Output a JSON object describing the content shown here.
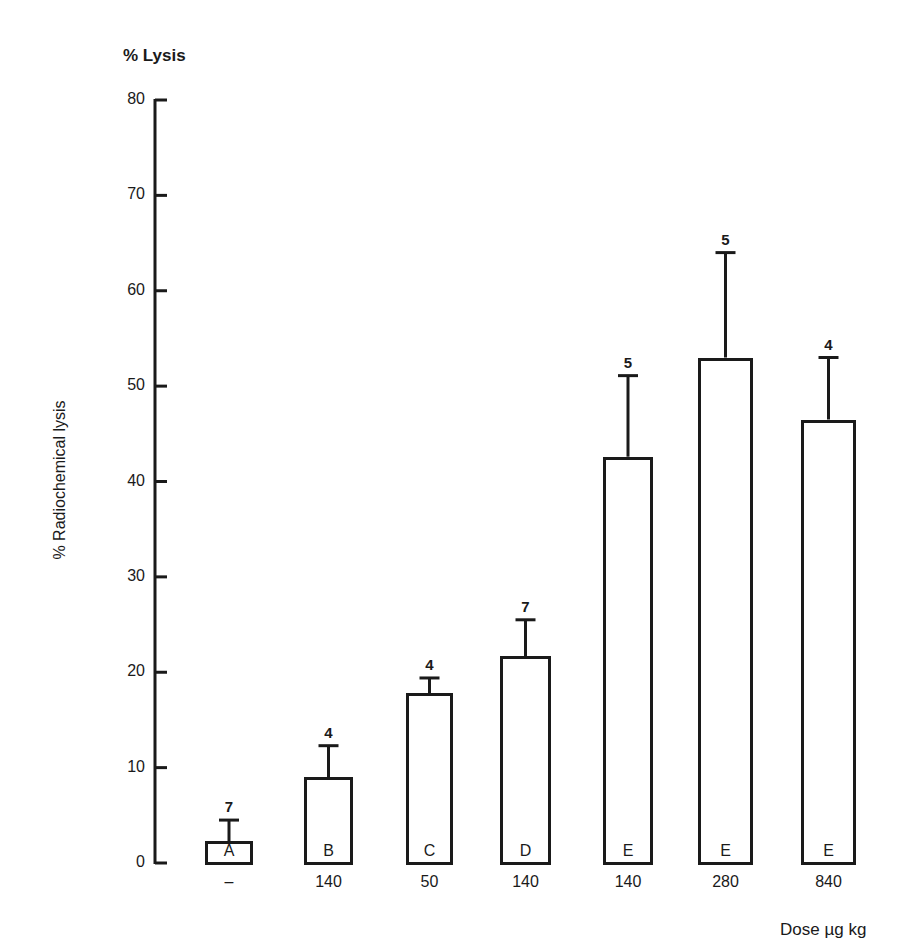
{
  "chart_data": {
    "type": "bar",
    "title": "% Lysis",
    "ylabel": "% Radiochemical lysis",
    "xlabel": "Dose µg kg",
    "ylim": [
      0,
      80
    ],
    "yticks": [
      0,
      10,
      20,
      30,
      40,
      50,
      60,
      70,
      80
    ],
    "grid": false,
    "categories": [
      "A",
      "B",
      "C",
      "D",
      "E",
      "E",
      "E"
    ],
    "dose_labels": [
      "–",
      "140",
      "50",
      "140",
      "140",
      "280",
      "840"
    ],
    "values": [
      2.3,
      9.0,
      17.8,
      21.7,
      42.6,
      53.0,
      46.5
    ],
    "error_upper": [
      4.5,
      12.3,
      19.4,
      25.5,
      51.1,
      64.0,
      53.0
    ],
    "n": [
      "7",
      "4",
      "4",
      "7",
      "5",
      "5",
      "4"
    ]
  },
  "labels": {
    "title": "% Lysis",
    "ylabel": "% Radiochemical lysis",
    "xunit": "Dose µg kg"
  }
}
